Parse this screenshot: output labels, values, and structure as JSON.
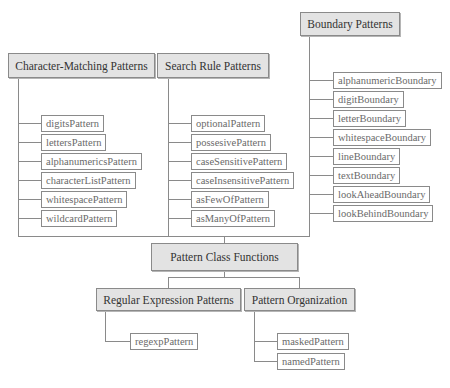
{
  "diagram": {
    "root": {
      "label": "Pattern Class Functions"
    },
    "groups": {
      "character_matching": {
        "label": "Character-Matching Patterns",
        "items": [
          "digitsPattern",
          "lettersPattern",
          "alphanumericsPattern",
          "characterListPattern",
          "whitespacePattern",
          "wildcardPattern"
        ]
      },
      "search_rule": {
        "label": "Search Rule Patterns",
        "items": [
          "optionalPattern",
          "possesivePattern",
          "caseSensitivePattern",
          "caseInsensitivePattern",
          "asFewOfPattern",
          "asManyOfPattern"
        ]
      },
      "boundary": {
        "label": "Boundary Patterns",
        "items": [
          "alphanumericBoundary",
          "digitBoundary",
          "letterBoundary",
          "whitespaceBoundary",
          "lineBoundary",
          "textBoundary",
          "lookAheadBoundary",
          "lookBehindBoundary"
        ]
      },
      "regular_expression": {
        "label": "Regular Expression Patterns",
        "items": [
          "regexpPattern"
        ]
      },
      "organization": {
        "label": "Pattern Organization",
        "items": [
          "maskedPattern",
          "namedPattern"
        ]
      }
    }
  }
}
